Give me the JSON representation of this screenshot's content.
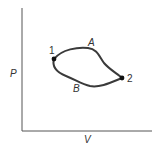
{
  "diagram": {
    "type": "pv-cycle",
    "axes": {
      "x_label": "V",
      "y_label": "P"
    },
    "states": [
      {
        "id": "1",
        "label": "1"
      },
      {
        "id": "2",
        "label": "2"
      }
    ],
    "paths": [
      {
        "id": "A",
        "label": "A",
        "from": "1",
        "to": "2",
        "position": "upper"
      },
      {
        "id": "B",
        "label": "B",
        "from": "2",
        "to": "1",
        "position": "lower"
      }
    ],
    "colors": {
      "line": "#3a3a3a",
      "axis": "#555555",
      "background": "#ffffff"
    }
  }
}
